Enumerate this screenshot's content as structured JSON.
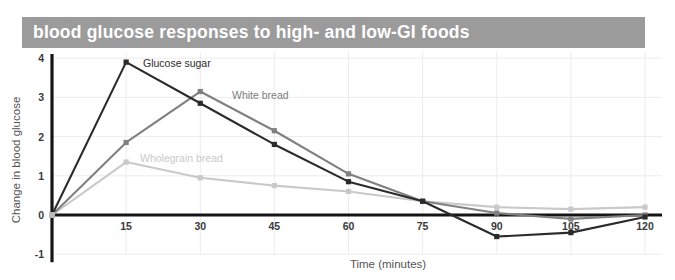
{
  "title": "blood glucose responses to high- and low-GI foods",
  "title_bar_color": "#9b9b9b",
  "title_text_color": "#ffffff",
  "background_color": "#ffffff",
  "axis": {
    "x_title": "Time (minutes)",
    "y_title": "Change in blood glucose",
    "x_ticks": [
      "15",
      "30",
      "45",
      "60",
      "75",
      "90",
      "105",
      "120"
    ],
    "y_ticks": [
      "4",
      "3",
      "2",
      "1",
      "0",
      "-1"
    ]
  },
  "series_labels": {
    "glucose_sugar": "Glucose sugar",
    "white_bread": "White bread",
    "wholegrain_bread": "Wholegrain bread"
  },
  "chart_data": {
    "type": "line",
    "title": "blood glucose responses to high- and low-GI foods",
    "xlabel": "Time (minutes)",
    "ylabel": "Change in blood glucose",
    "x": [
      0,
      15,
      30,
      45,
      60,
      75,
      90,
      105,
      120
    ],
    "xlim": [
      0,
      120
    ],
    "ylim": [
      -1,
      4
    ],
    "xticks": [
      15,
      30,
      45,
      60,
      75,
      90,
      105,
      120
    ],
    "yticks": [
      -1,
      0,
      1,
      2,
      3,
      4
    ],
    "grid": true,
    "legend": "inline-labels",
    "markers": "square",
    "series": [
      {
        "name": "Glucose sugar",
        "color": "#2b2b2b",
        "values": [
          0,
          3.9,
          2.85,
          1.8,
          0.85,
          0.35,
          -0.55,
          -0.45,
          -0.05
        ]
      },
      {
        "name": "White bread",
        "color": "#808080",
        "values": [
          0,
          1.85,
          3.15,
          2.15,
          1.05,
          0.35,
          0.05,
          -0.1,
          0.0
        ]
      },
      {
        "name": "Wholegrain bread",
        "color": "#c9c9c9",
        "values": [
          0,
          1.35,
          0.95,
          0.75,
          0.6,
          0.35,
          0.2,
          0.15,
          0.2
        ]
      }
    ]
  }
}
